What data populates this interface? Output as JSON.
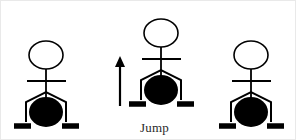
{
  "scene": {
    "title": "Jump",
    "background_color": "#ffffff",
    "stroke_color": "#000000",
    "fill_color": "#000000",
    "caption_color": "#2a2a2a"
  },
  "caption": {
    "text": "Jump",
    "x": 140,
    "y": 120
  },
  "arrow": {
    "name": "up-arrow",
    "direction": "up",
    "x": 120,
    "y_top": 56,
    "y_bottom": 106,
    "color": "#000000"
  },
  "figures": [
    {
      "id": "figure-left",
      "label": "standing-figure-left",
      "state": "standing",
      "origin_x": 10,
      "origin_y": 38,
      "head": {
        "cx": 46,
        "cy": 55,
        "rx": 17,
        "ry": 14
      },
      "neck": {
        "x": 46,
        "y1": 69,
        "y2": 100
      },
      "arms": {
        "y": 81,
        "x1": 27,
        "x2": 66
      },
      "legs": {
        "apex_x": 46,
        "apex_y": 92,
        "left_x": 26,
        "right_x": 66,
        "foot_y": 122
      },
      "ball": {
        "cx": 46,
        "cy": 112,
        "rx": 17,
        "ry": 15
      },
      "feet": [
        {
          "x1": 14,
          "x2": 31,
          "y": 126
        },
        {
          "x1": 62,
          "x2": 79,
          "y": 126
        }
      ]
    },
    {
      "id": "figure-middle",
      "label": "jumping-figure-middle",
      "state": "jumping",
      "origin_x": 125,
      "origin_y": 16,
      "head": {
        "cx": 161,
        "cy": 33,
        "rx": 17,
        "ry": 14
      },
      "neck": {
        "x": 161,
        "y1": 47,
        "y2": 78
      },
      "arms": {
        "y": 59,
        "x1": 142,
        "x2": 181
      },
      "legs": {
        "apex_x": 161,
        "apex_y": 70,
        "left_x": 141,
        "right_x": 181,
        "foot_y": 100
      },
      "ball": {
        "cx": 161,
        "cy": 90,
        "rx": 17,
        "ry": 15
      },
      "feet": [
        {
          "x1": 129,
          "x2": 146,
          "y": 104
        },
        {
          "x1": 177,
          "x2": 194,
          "y": 104
        }
      ]
    },
    {
      "id": "figure-right",
      "label": "standing-figure-right",
      "state": "standing",
      "origin_x": 215,
      "origin_y": 38,
      "head": {
        "cx": 251,
        "cy": 55,
        "rx": 17,
        "ry": 14
      },
      "neck": {
        "x": 251,
        "y1": 69,
        "y2": 100
      },
      "arms": {
        "y": 81,
        "x1": 232,
        "x2": 271
      },
      "legs": {
        "apex_x": 251,
        "apex_y": 92,
        "left_x": 231,
        "right_x": 271,
        "foot_y": 122
      },
      "ball": {
        "cx": 251,
        "cy": 112,
        "rx": 17,
        "ry": 15
      },
      "feet": [
        {
          "x1": 219,
          "x2": 236,
          "y": 126
        },
        {
          "x1": 267,
          "x2": 284,
          "y": 126
        }
      ]
    }
  ]
}
